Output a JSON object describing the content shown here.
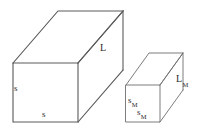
{
  "figure": {
    "background_color": "#ffffff",
    "line_color": "#5a5a5a",
    "text_color": "#2a2a2a"
  },
  "large_prism": {
    "name": "large-rectangular-prism",
    "labels": {
      "height": "s",
      "width": "s",
      "length": "L",
      "length_symbol": "L"
    },
    "geometry": {
      "front_face": {
        "x": 13,
        "y": 63,
        "width": 65,
        "height": 59
      },
      "depth_dx": 45,
      "depth_dy": -52
    }
  },
  "small_prism": {
    "name": "small-rectangular-prism",
    "labels": {
      "height_base": "s",
      "height_sub": "M",
      "width_base": "s",
      "width_sub": "M",
      "length_base": "L",
      "length_sub": "M"
    },
    "geometry": {
      "front_face": {
        "x": 126,
        "y": 85,
        "width": 34,
        "height": 37
      },
      "depth_dx": 23,
      "depth_dy": -32
    }
  }
}
